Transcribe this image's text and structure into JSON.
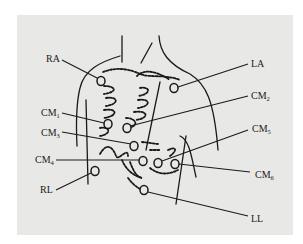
{
  "figure": {
    "title": "",
    "background_color": "#e8e8e6",
    "line_color": "#1a1a1a"
  },
  "labels": {
    "RA": {
      "text": "RA",
      "sub": ""
    },
    "LA": {
      "text": "LA",
      "sub": ""
    },
    "CM1": {
      "text": "CM",
      "sub": "1"
    },
    "CM2": {
      "text": "CM",
      "sub": "2"
    },
    "CM3": {
      "text": "CM",
      "sub": "3"
    },
    "CM4": {
      "text": "CM",
      "sub": "4"
    },
    "CM5": {
      "text": "CM",
      "sub": "5"
    },
    "CM6": {
      "text": "CM",
      "sub": "6"
    },
    "RL": {
      "text": "RL",
      "sub": ""
    },
    "LL": {
      "text": "LL",
      "sub": ""
    }
  },
  "electrodes": [
    {
      "id": "RA",
      "x": 101,
      "y": 81
    },
    {
      "id": "LA",
      "x": 174,
      "y": 88
    },
    {
      "id": "CM1",
      "x": 108,
      "y": 124
    },
    {
      "id": "CM2",
      "x": 127,
      "y": 128
    },
    {
      "id": "CM3",
      "x": 134,
      "y": 146
    },
    {
      "id": "CM4",
      "x": 143,
      "y": 161
    },
    {
      "id": "CM5",
      "x": 158,
      "y": 163
    },
    {
      "id": "CM6",
      "x": 175,
      "y": 164
    },
    {
      "id": "RL",
      "x": 95,
      "y": 171
    },
    {
      "id": "LL",
      "x": 144,
      "y": 190
    }
  ]
}
